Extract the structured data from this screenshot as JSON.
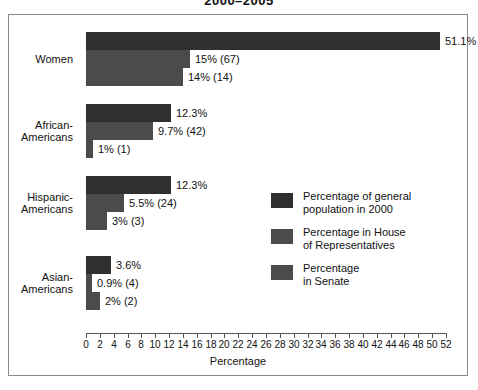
{
  "chart_data": {
    "type": "bar",
    "orientation": "horizontal",
    "title": "2000–2005",
    "xlabel": "Percentage",
    "ylabel": "",
    "xlim": [
      0,
      52
    ],
    "xticks": [
      0,
      2,
      4,
      6,
      8,
      10,
      12,
      14,
      16,
      18,
      20,
      22,
      24,
      26,
      28,
      30,
      32,
      34,
      36,
      38,
      40,
      42,
      44,
      46,
      48,
      50,
      52
    ],
    "grid": false,
    "legend_position": "center-right",
    "categories": [
      "Women",
      "African-Americans",
      "Hispanic-Americans",
      "Asian-Americans"
    ],
    "series": [
      {
        "name": "Percentage of general population in 2000",
        "color": "#2f2f2f",
        "values": [
          51.1,
          12.3,
          12.3,
          3.6
        ],
        "labels": [
          "51.1%",
          "12.3%",
          "12.3%",
          "3.6%"
        ]
      },
      {
        "name": "Percentage in House of Representatives",
        "color": "#4b4b4b",
        "values": [
          15,
          9.7,
          5.5,
          0.9
        ],
        "labels": [
          "15% (67)",
          "9.7% (42)",
          "5.5% (24)",
          "0.9% (4)"
        ]
      },
      {
        "name": "Percentage in Senate",
        "color": "#4b4b4b",
        "values": [
          14,
          1,
          3,
          2
        ],
        "labels": [
          "14% (14)",
          "1% (1)",
          "3% (3)",
          "2% (2)"
        ]
      }
    ]
  },
  "category_labels": [
    [
      "Women"
    ],
    [
      "African-",
      "Americans"
    ],
    [
      "Hispanic-",
      "Americans"
    ],
    [
      "Asian-",
      "Americans"
    ]
  ],
  "legend": [
    {
      "swatch": "legend-swatch-general-population",
      "lines": [
        "Percentage of general",
        "population in 2000"
      ]
    },
    {
      "swatch": "legend-swatch-house",
      "lines": [
        "Percentage in House",
        "of Representatives"
      ]
    },
    {
      "swatch": "legend-swatch-senate",
      "lines": [
        "Percentage",
        "in Senate"
      ]
    }
  ]
}
